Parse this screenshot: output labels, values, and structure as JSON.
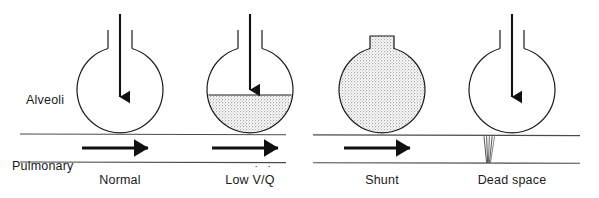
{
  "figure": {
    "width": 599,
    "height": 198,
    "background_color": "#ffffff",
    "ink_color": "#1a1a1a",
    "stipple_color": "#b8b8b8"
  },
  "row_labels": {
    "alveoli": "Alveoli",
    "capillary_line1": "Pulmonary",
    "capillary_line2": "capillary"
  },
  "panels": [
    {
      "id": "normal",
      "caption": "Normal",
      "center_x": 120,
      "airway": "open",
      "alveolus_fill": "empty",
      "fluid_level_fraction": 0,
      "airflow_arrow": true,
      "blood_flow_arrow": true,
      "capillary_state": "patent"
    },
    {
      "id": "low-v-q",
      "caption_prefix": "Low ",
      "caption_v": "V",
      "caption_slash": "/",
      "caption_q": "Q",
      "caption_dot": "˙",
      "caption": "Low V̇/Q̇",
      "center_x": 250,
      "airway": "open",
      "alveolus_fill": "partial-stipple",
      "fluid_level_fraction": 0.45,
      "airflow_arrow": true,
      "blood_flow_arrow": true,
      "capillary_state": "patent"
    },
    {
      "id": "shunt",
      "caption": "Shunt",
      "center_x": 382,
      "airway": "blocked",
      "alveolus_fill": "full-stipple",
      "fluid_level_fraction": 1,
      "airflow_arrow": false,
      "blood_flow_arrow": true,
      "capillary_state": "patent"
    },
    {
      "id": "dead-space",
      "caption": "Dead space",
      "center_x": 512,
      "airway": "open",
      "alveolus_fill": "empty",
      "fluid_level_fraction": 0,
      "airflow_arrow": true,
      "blood_flow_arrow": false,
      "capillary_state": "collapsed"
    }
  ]
}
